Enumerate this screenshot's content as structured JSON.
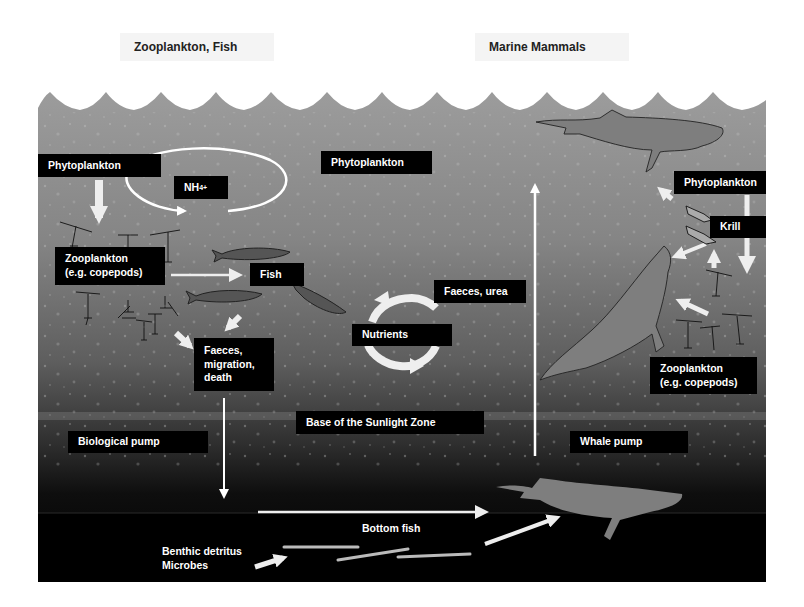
{
  "headers": {
    "left": "Zooplankton, Fish",
    "right": "Marine Mammals"
  },
  "colors": {
    "ocean_top": "#9a9a9a",
    "ocean_mid": "#6e6e6e",
    "ocean_deep": "#1a1a1a",
    "seafloor": "#000000",
    "whale": "#7d7d7d",
    "label_bg": "#000000",
    "label_text": "#ffffff",
    "arrow": "#ffffff",
    "arrow_soft": "#eeeeee"
  },
  "labels": {
    "phytoplankton_left": "Phytoplankton",
    "nh4_base": "NH",
    "nh4_sub": "4",
    "nh4_sup": "+",
    "zooplankton_left_line1": "Zooplankton",
    "zooplankton_left_line2": "(e.g. copepods)",
    "fish": "Fish",
    "faeces_line1": "Faeces,",
    "faeces_line2": "migration,",
    "faeces_line3": "death",
    "phytoplankton_center": "Phytoplankton",
    "faeces_urea": "Faeces, urea",
    "nutrients": "Nutrients",
    "base_sunlight_zone": "Base of the Sunlight Zone",
    "biological_pump": "Biological pump",
    "whale_pump": "Whale pump",
    "phytoplankton_right": "Phytoplankton",
    "krill": "Krill",
    "zooplankton_right_line1": "Zooplankton",
    "zooplankton_right_line2": "(e.g. copepods)",
    "bottom_fish": "Bottom fish",
    "benthic_line1": "Benthic detritus",
    "benthic_line2": "Microbes"
  }
}
